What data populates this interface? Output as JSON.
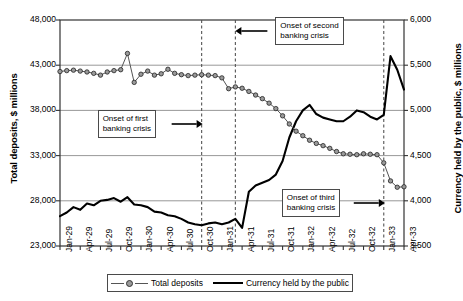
{
  "chart_data": {
    "type": "line",
    "title": "",
    "xlabel": "",
    "ylabel": "Total deposits, $ millions",
    "y2label": "Currency held by the public, $ millions",
    "ylim": [
      23000,
      48000
    ],
    "y2lim": [
      3500,
      6000
    ],
    "yticks": [
      "23,000",
      "28,000",
      "33,000",
      "38,000",
      "43,000",
      "48,000"
    ],
    "y2ticks": [
      "3,500",
      "4,000",
      "4,500",
      "5,000",
      "5,500",
      "6,000"
    ],
    "grid": true,
    "legend_position": "bottom",
    "x_tick_labels": [
      "Jan-29",
      "Apr-29",
      "Jul-29",
      "Oct-29",
      "Jan-30",
      "Apr-30",
      "Jul-30",
      "Oct-30",
      "Jan-31",
      "Apr-31",
      "Jul-31",
      "Oct-31",
      "Jan-32",
      "Apr-32",
      "Jul-32",
      "Oct-32",
      "Jan-33",
      "Apr-33"
    ],
    "x_months": [
      "Jan-29",
      "Feb-29",
      "Mar-29",
      "Apr-29",
      "May-29",
      "Jun-29",
      "Jul-29",
      "Aug-29",
      "Sep-29",
      "Oct-29",
      "Nov-29",
      "Dec-29",
      "Jan-30",
      "Feb-30",
      "Mar-30",
      "Apr-30",
      "May-30",
      "Jun-30",
      "Jul-30",
      "Aug-30",
      "Sep-30",
      "Oct-30",
      "Nov-30",
      "Dec-30",
      "Jan-31",
      "Feb-31",
      "Mar-31",
      "Apr-31",
      "May-31",
      "Jun-31",
      "Jul-31",
      "Aug-31",
      "Sep-31",
      "Oct-31",
      "Nov-31",
      "Dec-31",
      "Jan-32",
      "Feb-32",
      "Mar-32",
      "Apr-32",
      "May-32",
      "Jun-32",
      "Jul-32",
      "Aug-32",
      "Sep-32",
      "Oct-32",
      "Nov-32",
      "Dec-32",
      "Jan-33",
      "Feb-33",
      "Mar-33",
      "Apr-33"
    ],
    "series": [
      {
        "name": "Total deposits",
        "axis": "left",
        "units": "$ millions",
        "marker": "circle",
        "values": [
          42300,
          42400,
          42450,
          42350,
          42250,
          42100,
          41900,
          42250,
          42400,
          42500,
          44300,
          41100,
          42000,
          42350,
          41900,
          42050,
          42550,
          42100,
          41950,
          41850,
          41900,
          41950,
          41900,
          41850,
          41600,
          40400,
          40600,
          40450,
          40100,
          39700,
          39300,
          38800,
          38200,
          37400,
          36500,
          35700,
          35200,
          34700,
          34350,
          34100,
          33800,
          33450,
          33200,
          33150,
          33100,
          33200,
          33150,
          33100,
          32200,
          30200,
          29500,
          29550
        ]
      },
      {
        "name": "Currency held by the public",
        "axis": "right",
        "units": "$ millions",
        "marker": "none",
        "values": [
          3830,
          3870,
          3930,
          3900,
          3970,
          3950,
          4000,
          4010,
          4030,
          3990,
          4040,
          3960,
          3950,
          3930,
          3880,
          3870,
          3840,
          3830,
          3800,
          3760,
          3740,
          3730,
          3750,
          3760,
          3740,
          3760,
          3800,
          3700,
          4100,
          4170,
          4200,
          4230,
          4290,
          4440,
          4700,
          4880,
          5000,
          5060,
          4960,
          4920,
          4900,
          4880,
          4880,
          4930,
          5000,
          4980,
          4930,
          4900,
          4950,
          5600,
          5450,
          5230
        ]
      }
    ],
    "annotations": [
      {
        "id": "first",
        "text_line1": "Onset of first",
        "text_line2": "banking crisis",
        "arrow": "right",
        "target_x_label": "Oct-30"
      },
      {
        "id": "second",
        "text_line1": "Onset of second",
        "text_line2": "banking crisis",
        "arrow": "left",
        "target_x_label": "Mar-31"
      },
      {
        "id": "third",
        "text_line1": "Onset of third",
        "text_line2": "banking crisis",
        "arrow": "right",
        "target_x_label": "Jan-33"
      }
    ],
    "vertical_markers": [
      "Oct-30",
      "Mar-31",
      "Jan-33"
    ],
    "legend": [
      "Total deposits",
      "Currency held by the public"
    ],
    "colors": {
      "deposits_line": "#555555",
      "deposits_marker": "#9a9a9a",
      "currency_line": "#000000",
      "grid": "#8c8c8c",
      "axis": "#333333",
      "dashed": "#555555"
    }
  }
}
